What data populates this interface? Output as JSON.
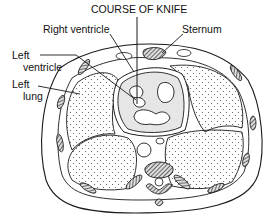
{
  "diagram": {
    "title": "COURSE OF KNIFE",
    "labels": {
      "right_ventricle": "Right ventricle",
      "sternum": "Sternum",
      "left_ventricle_line1": "Left",
      "left_ventricle_line2": "ventricle",
      "left_lung_line1": "Left",
      "left_lung_line2": "lung"
    },
    "colors": {
      "line": "#1a1a1a",
      "heart_fill": "#e6e6e6",
      "bone_fill": "#6a6a6a"
    }
  }
}
